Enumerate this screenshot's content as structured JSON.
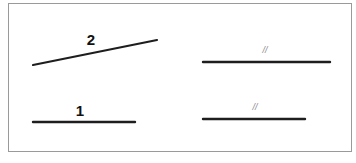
{
  "diagram": {
    "frame": {
      "x": 8,
      "y": 3,
      "width": 343,
      "height": 148,
      "stroke": "#9a9a9a"
    },
    "line_color": "#1e1e1e",
    "segments": [
      {
        "id": "segment-2",
        "label": "2",
        "x1": 33,
        "y1": 65,
        "x2": 157,
        "y2": 40,
        "label_x": 91,
        "label_y": 45
      },
      {
        "id": "segment-1",
        "label": "1",
        "x1": 33,
        "y1": 122,
        "x2": 135,
        "y2": 122,
        "label_x": 80,
        "label_y": 116
      },
      {
        "id": "segment-right-top",
        "label": "//",
        "x1": 203,
        "y1": 62,
        "x2": 330,
        "y2": 62,
        "label_x": 265,
        "label_y": 53
      },
      {
        "id": "segment-right-bottom",
        "label": "//",
        "x1": 203,
        "y1": 119,
        "x2": 305,
        "y2": 119,
        "label_x": 255,
        "label_y": 110
      }
    ]
  }
}
